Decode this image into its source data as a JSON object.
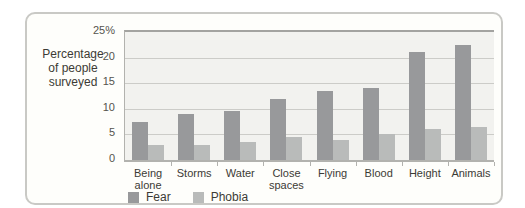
{
  "chart_data": {
    "type": "bar",
    "title": "",
    "ylabel": "Percentage of people surveyed",
    "ylabel_lines": [
      "Percentage",
      "of people",
      "surveyed"
    ],
    "categories": [
      "Being alone",
      "Storms",
      "Water",
      "Close spaces",
      "Flying",
      "Blood",
      "Height",
      "Animals"
    ],
    "series": [
      {
        "name": "Fear",
        "color": "#98999b",
        "values": [
          7.5,
          9,
          9.5,
          12,
          13.5,
          14,
          21,
          22.5
        ]
      },
      {
        "name": "Phobia",
        "color": "#b9bbba",
        "values": [
          3,
          3,
          3.5,
          4.5,
          4,
          5,
          6,
          6.5
        ]
      }
    ],
    "ylim": [
      0,
      25
    ],
    "yticks": [
      {
        "label": "25%",
        "value": 25
      },
      {
        "label": "20",
        "value": 20
      },
      {
        "label": "15",
        "value": 15
      },
      {
        "label": "10",
        "value": 10
      },
      {
        "label": "5",
        "value": 5
      },
      {
        "label": "0",
        "value": 0
      }
    ],
    "grid": true,
    "gridline_values": [
      20,
      15,
      10,
      5
    ],
    "legend_position": "bottom-left",
    "colors": {
      "plot_bg": "#f2f2ef",
      "card_bg": "#fefefb",
      "card_border": "#c9c9c5",
      "gridline": "#ccccc8",
      "axis": "#b2b2ae",
      "top_line": "#a3a3a0",
      "text": "#3c3b35",
      "tick_text": "#55544e"
    }
  }
}
